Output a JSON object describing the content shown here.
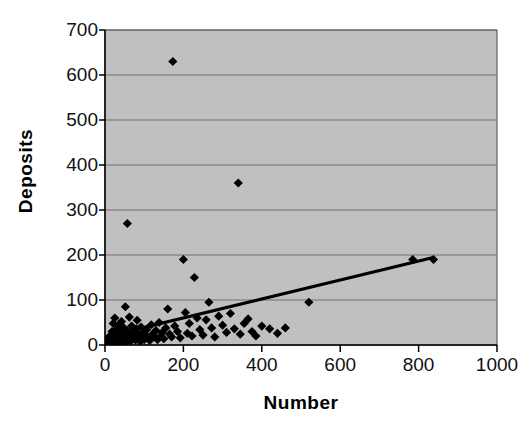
{
  "chart_data": {
    "type": "scatter",
    "title": "",
    "xlabel": "Number",
    "ylabel": "Deposits",
    "xlim": [
      0,
      1000
    ],
    "ylim": [
      0,
      700
    ],
    "x_ticks": [
      0,
      200,
      400,
      600,
      800,
      1000
    ],
    "y_ticks": [
      0,
      100,
      200,
      300,
      400,
      500,
      600,
      700
    ],
    "grid": "horizontal",
    "legend": "none",
    "plot_background_color": "#c0c0c0",
    "marker_color": "#000000",
    "marker_shape": "diamond",
    "trendline_color": "#000000",
    "series": [
      {
        "name": "Deposits vs Number",
        "points": [
          [
            6,
            2
          ],
          [
            8,
            6
          ],
          [
            10,
            10
          ],
          [
            12,
            4
          ],
          [
            14,
            14
          ],
          [
            15,
            22
          ],
          [
            16,
            8
          ],
          [
            18,
            30
          ],
          [
            20,
            3
          ],
          [
            21,
            48
          ],
          [
            22,
            18
          ],
          [
            24,
            12
          ],
          [
            25,
            60
          ],
          [
            26,
            26
          ],
          [
            28,
            5
          ],
          [
            30,
            35
          ],
          [
            31,
            9
          ],
          [
            33,
            20
          ],
          [
            35,
            44
          ],
          [
            36,
            14
          ],
          [
            38,
            7
          ],
          [
            40,
            28
          ],
          [
            42,
            52
          ],
          [
            44,
            16
          ],
          [
            46,
            10
          ],
          [
            48,
            38
          ],
          [
            50,
            22
          ],
          [
            52,
            85
          ],
          [
            54,
            6
          ],
          [
            56,
            32
          ],
          [
            57,
            270
          ],
          [
            58,
            18
          ],
          [
            60,
            12
          ],
          [
            62,
            62
          ],
          [
            64,
            26
          ],
          [
            66,
            9
          ],
          [
            68,
            42
          ],
          [
            70,
            15
          ],
          [
            72,
            30
          ],
          [
            75,
            20
          ],
          [
            78,
            11
          ],
          [
            80,
            36
          ],
          [
            82,
            55
          ],
          [
            85,
            24
          ],
          [
            88,
            14
          ],
          [
            90,
            8
          ],
          [
            92,
            40
          ],
          [
            95,
            18
          ],
          [
            98,
            28
          ],
          [
            100,
            12
          ],
          [
            103,
            22
          ],
          [
            106,
            34
          ],
          [
            110,
            16
          ],
          [
            114,
            10
          ],
          [
            118,
            45
          ],
          [
            122,
            25
          ],
          [
            126,
            18
          ],
          [
            130,
            32
          ],
          [
            134,
            12
          ],
          [
            138,
            50
          ],
          [
            142,
            20
          ],
          [
            146,
            28
          ],
          [
            150,
            14
          ],
          [
            155,
            38
          ],
          [
            160,
            80
          ],
          [
            165,
            24
          ],
          [
            170,
            18
          ],
          [
            173,
            630
          ],
          [
            178,
            42
          ],
          [
            185,
            30
          ],
          [
            192,
            16
          ],
          [
            200,
            190
          ],
          [
            205,
            72
          ],
          [
            210,
            26
          ],
          [
            215,
            48
          ],
          [
            222,
            20
          ],
          [
            228,
            150
          ],
          [
            235,
            60
          ],
          [
            242,
            34
          ],
          [
            250,
            22
          ],
          [
            258,
            56
          ],
          [
            265,
            95
          ],
          [
            272,
            38
          ],
          [
            280,
            18
          ],
          [
            290,
            64
          ],
          [
            300,
            44
          ],
          [
            310,
            28
          ],
          [
            320,
            70
          ],
          [
            330,
            36
          ],
          [
            340,
            360
          ],
          [
            345,
            24
          ],
          [
            355,
            48
          ],
          [
            365,
            58
          ],
          [
            375,
            30
          ],
          [
            385,
            20
          ],
          [
            400,
            42
          ],
          [
            420,
            36
          ],
          [
            440,
            26
          ],
          [
            460,
            38
          ],
          [
            520,
            95
          ],
          [
            785,
            190
          ],
          [
            838,
            190
          ]
        ]
      }
    ],
    "trendline": {
      "x_start": 0,
      "y_start": 18,
      "x_end": 840,
      "y_end": 195
    }
  },
  "axes": {
    "x_title": "Number",
    "y_title": "Deposits",
    "x_tick_labels": [
      "0",
      "200",
      "400",
      "600",
      "800",
      "1000"
    ],
    "y_tick_labels": [
      "0",
      "100",
      "200",
      "300",
      "400",
      "500",
      "600",
      "700"
    ]
  }
}
